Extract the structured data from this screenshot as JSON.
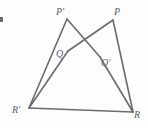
{
  "figure": {
    "type": "geometry-diagram",
    "width": 148,
    "height": 128,
    "background_color": "#fdfdfd",
    "stroke_color": "#6a6a70",
    "label_color": "#5f5f66",
    "stroke_width": 1.6,
    "vertices": [
      {
        "id": "P-prime",
        "label": "P'",
        "x": 67,
        "y": 19,
        "label_x": 56,
        "label_y": 7
      },
      {
        "id": "P",
        "label": "P",
        "x": 113,
        "y": 20,
        "label_x": 114,
        "label_y": 7
      },
      {
        "id": "Q",
        "label": "Q",
        "x": 68,
        "y": 51,
        "label_x": 56,
        "label_y": 49
      },
      {
        "id": "Q-prime",
        "label": "Q'",
        "x": 100,
        "y": 57,
        "label_x": 101,
        "label_y": 58
      },
      {
        "id": "R-prime",
        "label": "R'",
        "x": 29,
        "y": 108,
        "label_x": 12,
        "label_y": 105
      },
      {
        "id": "R",
        "label": "R",
        "x": 133,
        "y": 112,
        "label_x": 134,
        "label_y": 110
      }
    ],
    "segments": [
      {
        "id": "seg-Pprime-Qprime",
        "from": "P-prime",
        "to": "Q-prime",
        "x1": 67,
        "y1": 19,
        "x2": 100,
        "y2": 57
      },
      {
        "id": "seg-Qprime-R",
        "from": "Q-prime",
        "to": "R",
        "x1": 100,
        "y1": 57,
        "x2": 133,
        "y2": 112
      },
      {
        "id": "seg-Pprime-Rprime",
        "from": "P-prime",
        "to": "R-prime",
        "x1": 67,
        "y1": 19,
        "x2": 29,
        "y2": 108
      },
      {
        "id": "seg-Rprime-R",
        "from": "R-prime",
        "to": "R",
        "x1": 29,
        "y1": 108,
        "x2": 133,
        "y2": 112
      },
      {
        "id": "seg-P-Q",
        "from": "P",
        "to": "Q",
        "x1": 113,
        "y1": 20,
        "x2": 68,
        "y2": 51
      },
      {
        "id": "seg-Q-Rprime",
        "from": "Q",
        "to": "R-prime",
        "x1": 68,
        "y1": 51,
        "x2": 29,
        "y2": 108
      },
      {
        "id": "seg-P-R",
        "from": "P",
        "to": "R",
        "x1": 113,
        "y1": 20,
        "x2": 133,
        "y2": 112
      }
    ],
    "corner_mark": {
      "id": "corner-mark",
      "x": 0,
      "y": 17,
      "width": 3,
      "height": 5,
      "color": "#6a6a70"
    }
  }
}
